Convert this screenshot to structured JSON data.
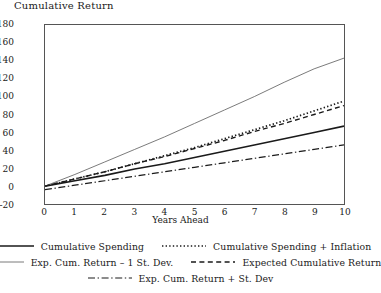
{
  "chart_data": {
    "type": "line",
    "title": "Cumulative Return",
    "xlabel": "Years Ahead",
    "ylabel": "",
    "xlim": [
      0,
      10
    ],
    "ylim": [
      -20,
      180
    ],
    "xticks": [
      0,
      1,
      2,
      3,
      4,
      5,
      6,
      7,
      8,
      9,
      10
    ],
    "yticks": [
      -20,
      0,
      20,
      40,
      60,
      80,
      100,
      120,
      140,
      160,
      180
    ],
    "grid": false,
    "legend_position": "below",
    "x": [
      0,
      1,
      2,
      3,
      4,
      5,
      6,
      7,
      8,
      9,
      10
    ],
    "series": [
      {
        "name": "Cumulative Spending",
        "style": "solid",
        "width": 1.6,
        "color": "#1a1a1a",
        "values": [
          0,
          6,
          12,
          19,
          25,
          32,
          39,
          46,
          53,
          60,
          67
        ]
      },
      {
        "name": "Cumulative Spending + Inflation",
        "style": "dotted",
        "width": 1.7,
        "color": "#1a1a1a",
        "values": [
          0,
          8,
          16,
          25,
          34,
          43,
          53,
          63,
          73,
          84,
          95
        ]
      },
      {
        "name": "Exp. Cum. Return – 1 St. Dev.",
        "style": "solid-thin",
        "width": 0.9,
        "color": "#6b6b6b",
        "values": [
          0,
          13,
          27,
          41,
          55,
          70,
          85,
          100,
          116,
          131,
          143
        ]
      },
      {
        "name": "Expected Cumulative Return",
        "style": "dashed",
        "width": 1.4,
        "color": "#1a1a1a",
        "values": [
          0,
          8,
          16,
          25,
          33,
          42,
          51,
          61,
          70,
          80,
          90
        ]
      },
      {
        "name": "Exp. Cum. Return + St. Dev",
        "style": "dashdot",
        "width": 1.2,
        "color": "#1a1a1a",
        "values": [
          -4,
          1,
          6,
          11,
          16,
          21,
          26,
          31,
          36,
          41,
          46
        ]
      }
    ]
  },
  "legend": {
    "rows": [
      [
        {
          "label": "Cumulative Spending",
          "key": "solid"
        },
        {
          "label": "Cumulative Spending + Inflation",
          "key": "dotted"
        }
      ],
      [
        {
          "label": "Exp. Cum. Return – 1 St. Dev.",
          "key": "solid-thin"
        },
        {
          "label": "Expected Cumulative Return",
          "key": "dashed"
        }
      ],
      [
        {
          "label": "Exp. Cum. Return + St. Dev",
          "key": "dashdot"
        }
      ]
    ]
  }
}
